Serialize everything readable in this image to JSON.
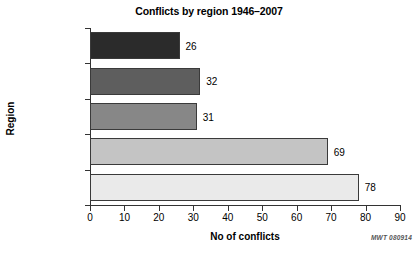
{
  "chart_data": {
    "type": "bar",
    "orientation": "horizontal",
    "title": "Conflicts by region 1946–2007",
    "xlabel": "No of conflicts",
    "ylabel": "Region",
    "categories": [
      "Americas",
      "Europe",
      "Middle East",
      "Asia",
      "Africa"
    ],
    "values": [
      26,
      32,
      31,
      69,
      78
    ],
    "value_labels": [
      "26",
      "32",
      "31",
      "69",
      "78"
    ],
    "xlim": [
      0,
      90
    ],
    "xticks": [
      0,
      10,
      20,
      30,
      40,
      50,
      60,
      70,
      80,
      90
    ],
    "xtick_labels": [
      "0",
      "10",
      "20",
      "30",
      "40",
      "50",
      "60",
      "70",
      "80",
      "90"
    ],
    "grid": false,
    "legend": null,
    "bar_colors": [
      "#2b2b2b",
      "#5e5e5e",
      "#878787",
      "#c4c4c4",
      "#eaeaea"
    ],
    "bar_edge_color": "#3a3a3a",
    "axis_color": "#333333",
    "background": "#ffffff"
  },
  "annotations": {
    "watermark": "MWT 080914"
  }
}
